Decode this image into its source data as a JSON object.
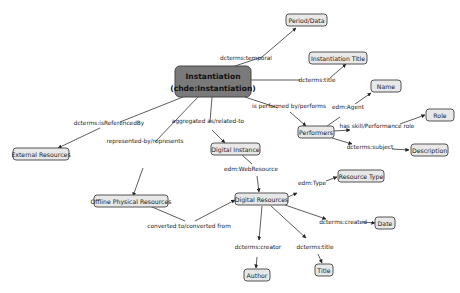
{
  "diagram": {
    "nodes": {
      "instantiation": {
        "line1": "Instantiation",
        "line2": "(chde:Instantiation)"
      },
      "period_date": {
        "label": "Period/Data"
      },
      "instantiation_title": {
        "label": "Instantiation Title"
      },
      "name": {
        "label": "Name"
      },
      "role": {
        "label": "Role"
      },
      "performers": {
        "label": "Performers"
      },
      "description": {
        "label": "Description"
      },
      "external_resources": {
        "label": "External Resources"
      },
      "digital_instance": {
        "label": "Digital Instance"
      },
      "offline_physical_resources": {
        "label": "Offline Physical Resources"
      },
      "digital_resources": {
        "label": "Digital Resources"
      },
      "resource_type": {
        "label": "Resource Type"
      },
      "date": {
        "label": "Date"
      },
      "author": {
        "label": "Author"
      },
      "title": {
        "label": "Title"
      }
    },
    "edges": {
      "temporal": "dcterms:temporal",
      "title_inst": "dcterms:title",
      "is_referenced_by": "dcterms:isReferencedBy",
      "represented_by": "represented-by/represents",
      "aggregated": "aggregated as/related-to",
      "performed_by": "is performed by/performs",
      "edm_agent": "edm:Agent",
      "has_skill": "has skill/Performance role",
      "subject": "dcterms:subject",
      "web_resource": "edm:WebResource",
      "edm_type": "edm:Type",
      "created": "dcterms:created",
      "creator": "dcterms:creator",
      "title_dr": "dcterms:title",
      "converted": "converted to/converted from"
    },
    "colors": {
      "main_node": "#7a7a7a",
      "node_fill": "#e8e8e8",
      "edge": "#333333"
    }
  }
}
